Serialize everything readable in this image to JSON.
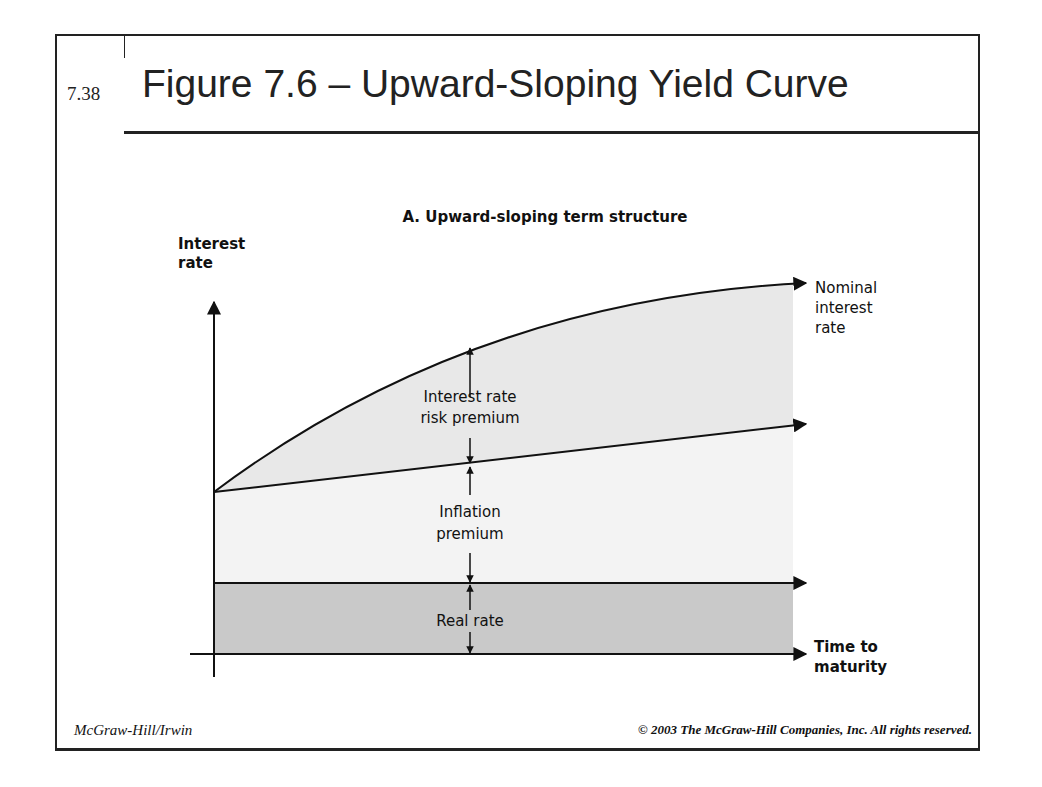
{
  "slide": {
    "number": "7.38",
    "title": "Figure 7.6 – Upward-Sloping Yield Curve",
    "footer_left": "McGraw-Hill/Irwin",
    "footer_right": "© 2003 The McGraw-Hill Companies, Inc. All rights reserved."
  },
  "diagram": {
    "subtitle": "A. Upward-sloping term structure",
    "y_axis_label_line1": "Interest",
    "y_axis_label_line2": "rate",
    "x_axis_label_line1": "Time to",
    "x_axis_label_line2": "maturity",
    "nominal_label_line1": "Nominal",
    "nominal_label_line2": "interest",
    "nominal_label_line3": "rate",
    "risk_premium_line1": "Interest rate",
    "risk_premium_line2": "risk premium",
    "inflation_line1": "Inflation",
    "inflation_line2": "premium",
    "real_rate": "Real rate"
  },
  "colors": {
    "line": "#111111",
    "light_fill": "#e6e6e6",
    "dark_fill": "#c8c8c8"
  }
}
